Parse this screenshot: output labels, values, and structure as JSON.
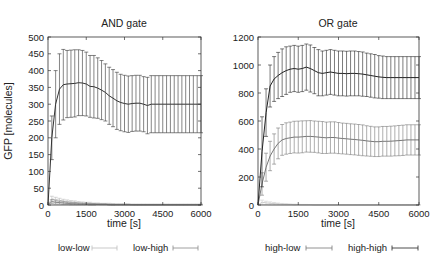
{
  "chart_data": [
    {
      "type": "line",
      "title": "AND gate",
      "xlabel": "time [s]",
      "ylabel": "GFP [molecules]",
      "xlim": [
        0,
        6000
      ],
      "ylim": [
        0,
        500
      ],
      "xticks": [
        0,
        1500,
        3000,
        4500,
        6000
      ],
      "yticks": [
        0,
        50,
        100,
        150,
        200,
        250,
        300,
        350,
        400,
        450,
        500
      ],
      "grid": false,
      "legend_position": "bottom",
      "x": [
        0,
        150,
        300,
        450,
        600,
        750,
        900,
        1050,
        1200,
        1350,
        1500,
        1650,
        1800,
        1950,
        2100,
        2250,
        2400,
        2550,
        2700,
        2850,
        3000,
        3150,
        3300,
        3450,
        3600,
        3750,
        3900,
        4050,
        4200,
        4350,
        4500,
        4650,
        4800,
        4950,
        5100,
        5250,
        5400,
        5550,
        5700,
        5850,
        6000
      ],
      "series": [
        {
          "name": "low-low",
          "color": "#bbbbbb",
          "values": [
            0,
            18,
            16,
            14,
            12,
            10,
            9,
            8,
            7,
            6,
            5,
            5,
            4,
            4,
            3,
            3,
            3,
            2,
            2,
            2,
            2,
            2,
            1,
            1,
            1,
            1,
            1,
            1,
            1,
            1,
            1,
            1,
            1,
            1,
            1,
            1,
            1,
            1,
            1,
            1,
            1
          ],
          "error": [
            0,
            8,
            7,
            6,
            5,
            5,
            4,
            4,
            3,
            3,
            3,
            3,
            2,
            2,
            2,
            2,
            2,
            2,
            1,
            1,
            1,
            1,
            1,
            1,
            1,
            1,
            1,
            1,
            1,
            1,
            1,
            1,
            1,
            1,
            1,
            1,
            1,
            1,
            1,
            1,
            1
          ]
        },
        {
          "name": "low-high",
          "color": "#888888",
          "values": [
            0,
            10,
            8,
            7,
            6,
            5,
            4,
            4,
            3,
            3,
            3,
            2,
            2,
            2,
            2,
            2,
            1,
            1,
            1,
            1,
            1,
            1,
            1,
            1,
            1,
            1,
            1,
            1,
            1,
            1,
            1,
            1,
            1,
            1,
            1,
            1,
            1,
            1,
            1,
            1,
            1
          ],
          "error": [
            0,
            6,
            5,
            4,
            4,
            3,
            3,
            3,
            2,
            2,
            2,
            2,
            2,
            1,
            1,
            1,
            1,
            1,
            1,
            1,
            1,
            1,
            1,
            1,
            1,
            1,
            1,
            1,
            1,
            1,
            1,
            1,
            1,
            1,
            1,
            1,
            1,
            1,
            1,
            1,
            1
          ]
        },
        {
          "name": "AND output (high-high)",
          "color": "#333333",
          "values": [
            0,
            200,
            300,
            345,
            358,
            360,
            361,
            362,
            364,
            363,
            360,
            353,
            352,
            348,
            342,
            335,
            325,
            318,
            310,
            305,
            302,
            300,
            302,
            303,
            303,
            300,
            296,
            300,
            300,
            300,
            300,
            300,
            300,
            300,
            300,
            300,
            300,
            300,
            300,
            300,
            300
          ],
          "error": [
            0,
            65,
            100,
            105,
            105,
            100,
            100,
            100,
            98,
            97,
            95,
            92,
            93,
            90,
            88,
            85,
            85,
            85,
            85,
            84,
            84,
            84,
            83,
            83,
            83,
            82,
            84,
            85,
            85,
            85,
            85,
            85,
            85,
            85,
            85,
            85,
            85,
            85,
            85,
            85,
            85
          ]
        }
      ]
    },
    {
      "type": "line",
      "title": "OR gate",
      "xlabel": "time [s]",
      "ylabel": "",
      "xlim": [
        0,
        6000
      ],
      "ylim": [
        0,
        1200
      ],
      "xticks": [
        0,
        1500,
        3000,
        4500,
        6000
      ],
      "yticks": [
        0,
        200,
        400,
        600,
        800,
        1000,
        1200
      ],
      "grid": false,
      "legend_position": "bottom",
      "x": [
        0,
        150,
        300,
        450,
        600,
        750,
        900,
        1050,
        1200,
        1350,
        1500,
        1650,
        1800,
        1950,
        2100,
        2250,
        2400,
        2550,
        2700,
        2850,
        3000,
        3150,
        3300,
        3450,
        3600,
        3750,
        3900,
        4050,
        4200,
        4350,
        4500,
        4650,
        4800,
        4950,
        5100,
        5250,
        5400,
        5550,
        5700,
        5850,
        6000
      ],
      "series": [
        {
          "name": "low-low",
          "color": "#cccccc",
          "values": [
            0,
            20,
            15,
            12,
            10,
            8,
            6,
            5,
            4,
            3,
            3,
            2,
            2,
            2,
            1,
            1,
            1,
            1,
            1,
            1,
            1,
            1,
            1,
            1,
            1,
            1,
            1,
            1,
            1,
            1,
            1,
            1,
            1,
            1,
            1,
            1,
            1,
            1,
            1,
            1,
            1
          ],
          "error": [
            0,
            15,
            12,
            10,
            8,
            6,
            5,
            4,
            3,
            3,
            2,
            2,
            2,
            1,
            1,
            1,
            1,
            1,
            1,
            1,
            1,
            1,
            1,
            1,
            1,
            1,
            1,
            1,
            1,
            1,
            1,
            1,
            1,
            1,
            1,
            1,
            1,
            1,
            1,
            1,
            1
          ]
        },
        {
          "name": "high-low",
          "color": "#777777",
          "values": [
            0,
            150,
            270,
            350,
            400,
            440,
            465,
            475,
            480,
            485,
            485,
            487,
            490,
            490,
            488,
            485,
            482,
            480,
            482,
            482,
            478,
            475,
            473,
            470,
            468,
            465,
            462,
            458,
            455,
            452,
            452,
            455,
            455,
            456,
            458,
            460,
            462,
            465,
            465,
            465,
            465
          ],
          "error": [
            0,
            80,
            100,
            105,
            108,
            110,
            110,
            112,
            112,
            113,
            114,
            114,
            112,
            113,
            112,
            113,
            114,
            112,
            112,
            112,
            111,
            110,
            110,
            110,
            110,
            110,
            110,
            108,
            107,
            106,
            106,
            106,
            106,
            107,
            107,
            108,
            108,
            108,
            108,
            108,
            108
          ]
        },
        {
          "name": "high-high",
          "color": "#222222",
          "values": [
            0,
            380,
            660,
            850,
            900,
            925,
            945,
            960,
            970,
            975,
            970,
            975,
            985,
            975,
            960,
            945,
            940,
            945,
            950,
            945,
            940,
            940,
            938,
            940,
            940,
            938,
            935,
            930,
            925,
            920,
            915,
            912,
            910,
            910,
            910,
            910,
            910,
            910,
            910,
            910,
            910
          ],
          "error": [
            0,
            250,
            170,
            150,
            160,
            165,
            170,
            170,
            165,
            165,
            165,
            165,
            165,
            168,
            165,
            165,
            160,
            160,
            160,
            160,
            160,
            160,
            160,
            160,
            160,
            158,
            158,
            155,
            155,
            155,
            152,
            152,
            150,
            150,
            150,
            150,
            150,
            150,
            150,
            150,
            150
          ]
        }
      ]
    }
  ],
  "legend": {
    "left": [
      {
        "label": "low-low",
        "color": "#bbbbbb"
      },
      {
        "label": "low-high",
        "color": "#888888"
      }
    ],
    "right": [
      {
        "label": "high-low",
        "color": "#777777"
      },
      {
        "label": "high-high",
        "color": "#222222"
      }
    ]
  }
}
